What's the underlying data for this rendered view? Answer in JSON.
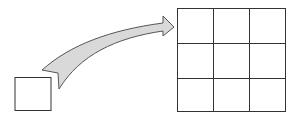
{
  "diagram": {
    "source": {
      "shape": "square"
    },
    "arrow": {
      "fill": "#d9d9d9",
      "stroke": "#555555"
    },
    "target": {
      "shape": "grid",
      "rows": 3,
      "cols": 3
    },
    "colors": {
      "line": "#333333",
      "background": "#ffffff"
    }
  }
}
